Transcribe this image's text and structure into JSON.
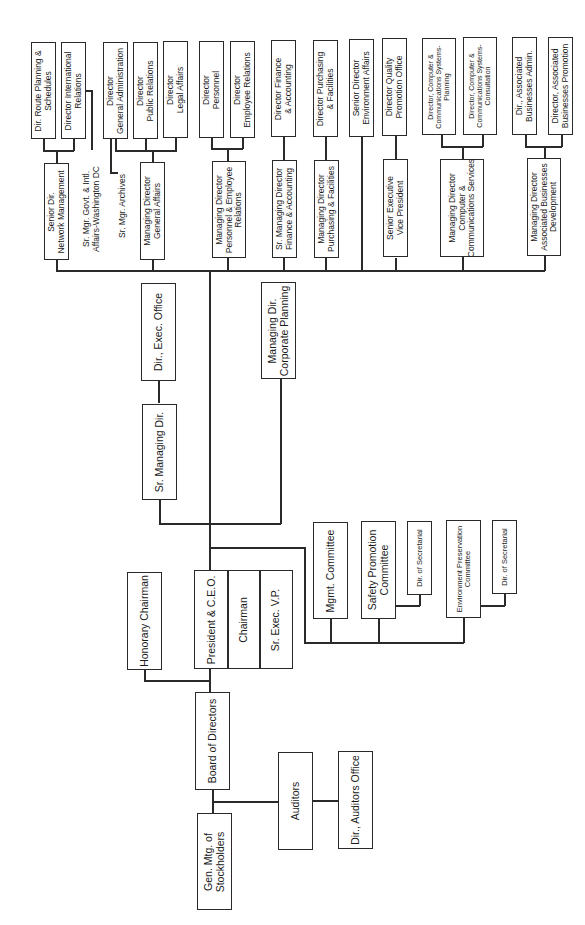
{
  "chart_title": "",
  "nodes": {
    "gen_mtg": "Gen. Mtg. of\nStockholders",
    "board": "Board of Directors",
    "auditors": "Auditors",
    "dir_auditors_office": "Dir., Auditors Office",
    "honorary_chairman": "Honorary Chairman",
    "president_ceo": "President & C.E.O.",
    "chairman": "Chairman",
    "sr_exec_vp": "Sr. Exec. V.P.",
    "mgmt_committee": "Mgmt. Committee",
    "safety_committee": "Safety Promotion\nCommittee",
    "dir_secretarial_1": "Dir. of Secretarial",
    "env_committee": "Environment Preservation\nCommittee",
    "dir_secretarial_2": "Dir. of Secretarial",
    "sr_managing_dir": "Sr. Managing Dir.",
    "dir_exec_office": "Dir., Exec. Office",
    "md_corporate_planning": "Managing Dir.\nCorporate Planning",
    "senior_dir_network": "Senior Dir.\nNetwork Management",
    "dir_route_planning": "Dir. Route Planning &\nSchedules",
    "dir_international_relations": "Director International\nRelations",
    "sr_mgr_govt": "Sr. Mgr. Govt. & Intl.\nAffairs-Washington DC",
    "sr_mgr_archives": "Sr. Mgr. Archives",
    "md_general_affairs": "Managing Director\nGeneral Affairs",
    "dir_general_admin": "Director\nGeneral Administration",
    "dir_public_relations": "Director\nPublic Relations",
    "dir_legal_affairs": "Director\nLegal Affairs",
    "md_personnel": "Managing Director\nPersonnel & Employee\nRelations",
    "dir_personnel": "Director\nPersonnel",
    "dir_employee_relations": "Director\nEmployee Relations",
    "sr_md_finance": "Sr. Managing Director\nFinance & Accounting",
    "dir_finance": "Director Finance\n& Accounting",
    "md_purchasing": "Managing Director\nPurchasing & Facilities",
    "dir_purchasing": "Director Purchasing\n& Facilities",
    "senior_dir_environment": "Senior Director\nEnvironment Affairs",
    "senior_evp": "Senior Executive\nVice President",
    "dir_quality": "Director Quality\nPromotion Office",
    "md_computer": "Managing Director\nComputer &\nCommunications Services",
    "dir_computer_planning": "Director, Computer &\nCommunications Systems-\nPlanning",
    "dir_computer_consultation": "Director, Computer &\nCommunications Systems-\nConsultation",
    "md_associated": "Managing Director\nAssociated Businesses\nDevelopment",
    "dir_associated_admin": "Dir., Associated\nBusinesses Admin.",
    "dir_associated_promotion": "Director, Associated\nBusinesses Promotion"
  },
  "colors": {
    "line": "#2a2a2a",
    "box_fill": "#ffffff",
    "text": "#1a1a1a"
  }
}
